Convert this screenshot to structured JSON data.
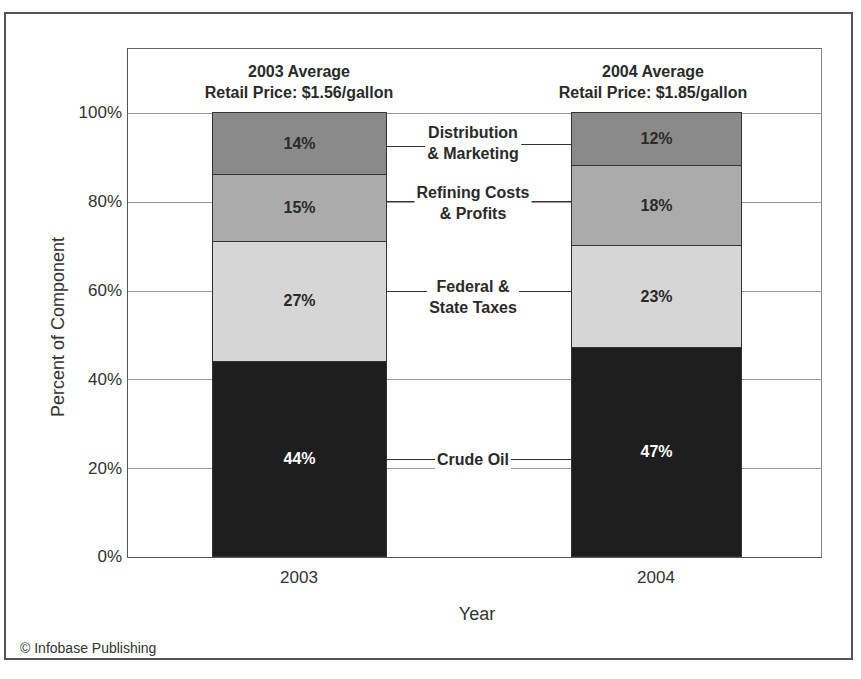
{
  "chart_data": {
    "type": "bar",
    "stacked": true,
    "title": "",
    "xlabel": "Year",
    "ylabel": "Percent of Component",
    "ylim": [
      0,
      100
    ],
    "yticks": [
      "0%",
      "20%",
      "40%",
      "60%",
      "80%",
      "100%"
    ],
    "categories": [
      "2003",
      "2004"
    ],
    "category_titles": [
      {
        "line1": "2003 Average",
        "line2": "Retail Price: $1.56/gallon"
      },
      {
        "line1": "2004 Average",
        "line2": "Retail Price: $1.85/gallon"
      }
    ],
    "series": [
      {
        "name": "Crude Oil",
        "values": [
          44,
          47
        ],
        "labels": [
          "44%",
          "47%"
        ],
        "color": "#1e1e1e",
        "text_color": "#ffffff"
      },
      {
        "name": "Federal & State Taxes",
        "values": [
          27,
          23
        ],
        "labels": [
          "27%",
          "23%"
        ],
        "color": "#d6d6d6",
        "text_color": "#2a2a2a"
      },
      {
        "name": "Refining Costs & Profits",
        "values": [
          15,
          18
        ],
        "labels": [
          "15%",
          "18%"
        ],
        "color": "#ababab",
        "text_color": "#2a2a2a"
      },
      {
        "name": "Distribution & Marketing",
        "values": [
          14,
          12
        ],
        "labels": [
          "14%",
          "12%"
        ],
        "color": "#8a8a8a",
        "text_color": "#2a2a2a"
      }
    ],
    "segment_labels": [
      {
        "line1": "Crude Oil",
        "line2": ""
      },
      {
        "line1": "Federal &",
        "line2": "State Taxes"
      },
      {
        "line1": "Refining Costs",
        "line2": "& Profits"
      },
      {
        "line1": "Distribution",
        "line2": "& Marketing"
      }
    ],
    "grid": true,
    "legend_position": "inline-between-bars"
  },
  "credit": "© Infobase Publishing"
}
